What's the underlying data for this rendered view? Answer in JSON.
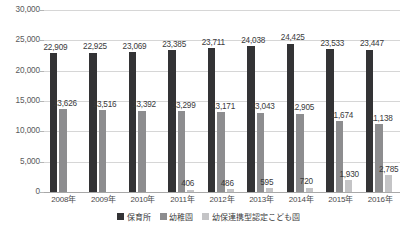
{
  "chart_data": {
    "type": "bar",
    "title": "",
    "xlabel": "",
    "ylabel": "",
    "ylim": [
      0,
      30000
    ],
    "yticks": [
      "0",
      "5,000",
      "10,000",
      "15,000",
      "20,000",
      "25,000",
      "30,000"
    ],
    "ytick_values": [
      0,
      5000,
      10000,
      15000,
      20000,
      25000,
      30000
    ],
    "grid": true,
    "legend_position": "bottom",
    "categories": [
      "2008年",
      "2009年",
      "2010年",
      "2011年",
      "2012年",
      "2013年",
      "2014年",
      "2015年",
      "2016年"
    ],
    "series": [
      {
        "name": "保育所",
        "color": "#333335",
        "values": [
          22909,
          22925,
          23069,
          23385,
          23711,
          24038,
          24425,
          23533,
          23447
        ],
        "labels": [
          "22,909",
          "22,925",
          "23,069",
          "23,385",
          "23,711",
          "24,038",
          "24,425",
          "23,533",
          "23,447"
        ]
      },
      {
        "name": "幼稚園",
        "color": "#8d8d8f",
        "values": [
          13626,
          13516,
          13392,
          13299,
          13171,
          13043,
          12905,
          11674,
          11138
        ],
        "labels": [
          "13,626",
          "13,516",
          "13,392",
          "13,299",
          "13,171",
          "13,043",
          "12,905",
          "11,674",
          "11,138"
        ]
      },
      {
        "name": "幼保連携型認定こども園",
        "color": "#c4c4c6",
        "values": [
          null,
          null,
          null,
          406,
          486,
          595,
          720,
          1930,
          2785
        ],
        "labels": [
          "",
          "",
          "",
          "406",
          "486",
          "595",
          "720",
          "1,930",
          "2,785"
        ]
      }
    ]
  }
}
